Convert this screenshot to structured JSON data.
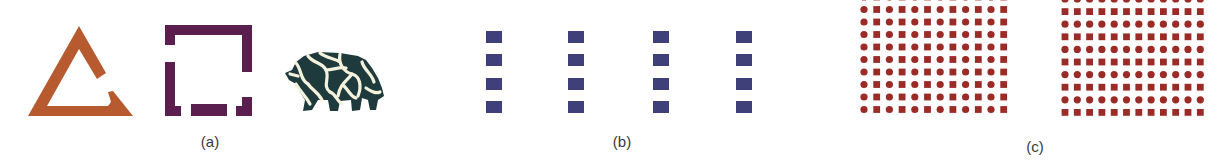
{
  "figure": {
    "panels": [
      {
        "id": "a",
        "label": "(a)",
        "shapes": [
          {
            "kind": "fragmented-triangle",
            "color": "#b85a30"
          },
          {
            "kind": "fragmented-square",
            "color": "#5a1f4e"
          },
          {
            "kind": "camouflaged-animal",
            "color": "#1e3a3c",
            "crack_color": "#f4f1dc"
          }
        ]
      },
      {
        "id": "b",
        "label": "(b)",
        "grid": {
          "rows": 4,
          "cols": 4,
          "mark": "square",
          "color": "#3f3f7a"
        }
      },
      {
        "id": "c",
        "label": "(c)",
        "grids": [
          {
            "rows": 10,
            "cols": 12,
            "pattern": "alternating-columns",
            "first": "circle",
            "color": "#9b2b27"
          },
          {
            "rows": 10,
            "cols": 12,
            "pattern": "alternating-rows",
            "first": "circle",
            "color": "#9b2b27"
          }
        ]
      }
    ]
  }
}
